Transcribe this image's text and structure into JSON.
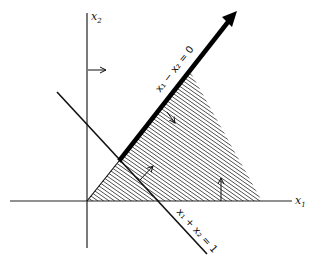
{
  "diagram": {
    "axes": {
      "x_label_base": "x",
      "x_label_sub": "1",
      "y_label_base": "x",
      "y_label_sub": "2"
    },
    "lines": [
      {
        "id": "line-1",
        "label": "x₁ − x₂ = 0",
        "style": "thick-arrow"
      },
      {
        "id": "line-2",
        "label": "x₁ + x₂ = 1",
        "style": "thin"
      }
    ],
    "region": {
      "fill": "diagonal-hatch",
      "description": "shaded feasible region"
    },
    "colors": {
      "ink": "#111111",
      "background": "#ffffff"
    }
  }
}
